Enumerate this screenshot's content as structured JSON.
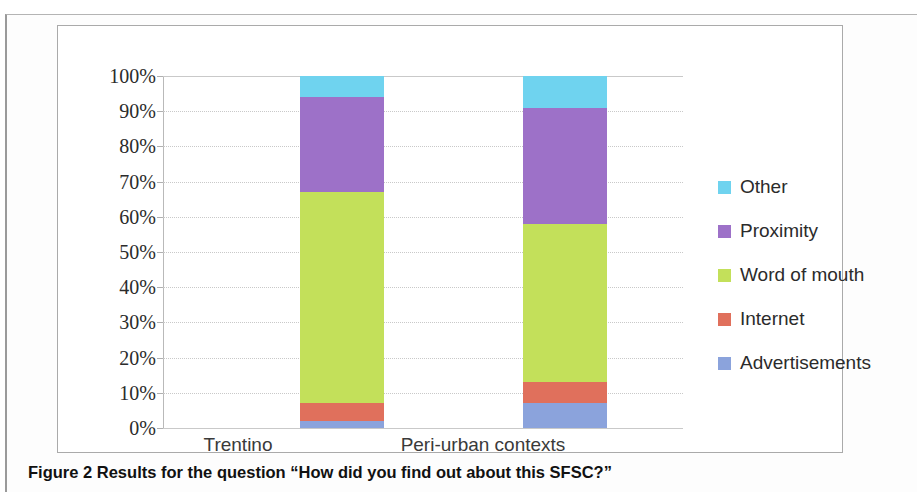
{
  "figure": {
    "caption_label": "Figure 2",
    "caption_text": "Results for the question “How did you find out about this SFSC?”"
  },
  "legend": {
    "position": "right",
    "items": [
      {
        "label": "Other",
        "color": "#6FD3EF"
      },
      {
        "label": "Proximity",
        "color": "#9D71C8"
      },
      {
        "label": "Word of mouth",
        "color": "#C3E05A"
      },
      {
        "label": "Internet",
        "color": "#E0705C"
      },
      {
        "label": "Advertisements",
        "color": "#8BA3DC"
      }
    ]
  },
  "axis": {
    "y_ticks": [
      "100%",
      "90%",
      "80%",
      "70%",
      "60%",
      "50%",
      "40%",
      "30%",
      "20%",
      "10%",
      "0%"
    ],
    "x_ticks": [
      "Trentino",
      "Peri-urban contexts"
    ]
  },
  "chart_data": {
    "type": "bar",
    "subtype": "stacked-100-percent",
    "title": "",
    "xlabel": "",
    "ylabel": "",
    "ylim": [
      0,
      100
    ],
    "ytick_values": [
      0,
      10,
      20,
      30,
      40,
      50,
      60,
      70,
      80,
      90,
      100
    ],
    "grid": true,
    "legend_position": "right",
    "categories": [
      "Trentino",
      "Peri-urban contexts"
    ],
    "series": [
      {
        "name": "Advertisements",
        "color": "#8BA3DC",
        "values": [
          2,
          7
        ]
      },
      {
        "name": "Internet",
        "color": "#E0705C",
        "values": [
          5,
          6
        ]
      },
      {
        "name": "Word of mouth",
        "color": "#C3E05A",
        "values": [
          60,
          45
        ]
      },
      {
        "name": "Proximity",
        "color": "#9D71C8",
        "values": [
          27,
          33
        ]
      },
      {
        "name": "Other",
        "color": "#6FD3EF",
        "values": [
          6,
          9
        ]
      }
    ],
    "stack_order_bottom_to_top": [
      "Advertisements",
      "Internet",
      "Word of mouth",
      "Proximity",
      "Other"
    ],
    "cumulative_tops": {
      "Trentino": [
        2,
        7,
        67,
        94,
        100
      ],
      "Peri-urban contexts": [
        7,
        13,
        58,
        91,
        100
      ]
    }
  }
}
